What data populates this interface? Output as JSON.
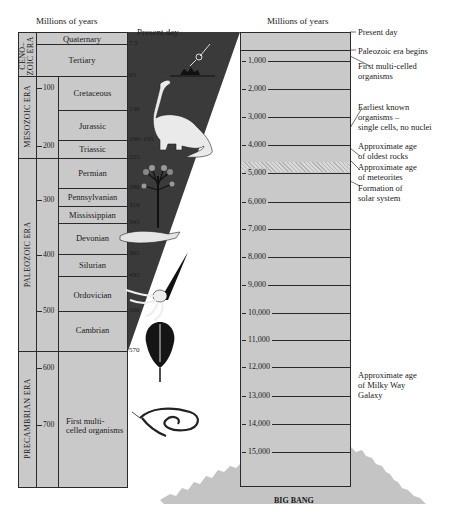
{
  "left_scale": {
    "header": "Millions of years",
    "present_day_label": "Present day",
    "eras": [
      {
        "name": "CENO-\nZOIC ERA",
        "line1": "CENO–",
        "line2": "ZOIC ERA"
      },
      {
        "name": "MESOZOIC ERA"
      },
      {
        "name": "PALEOZOIC ERA"
      },
      {
        "name": "PRECAMBRIAN ERA"
      }
    ],
    "periods": [
      {
        "name": "Quaternary"
      },
      {
        "name": "Tertiary"
      },
      {
        "name": "Cretaceous"
      },
      {
        "name": "Jurassic"
      },
      {
        "name": "Triassic"
      },
      {
        "name": "Permian"
      },
      {
        "name": "Pennsylvanian"
      },
      {
        "name": "Mississippian"
      },
      {
        "name": "Devonian"
      },
      {
        "name": "Silurian"
      },
      {
        "name": "Ordovician"
      },
      {
        "name": "Cambrian"
      },
      {
        "name": "First multi-celled organisms",
        "line1": "First multi-",
        "line2": "celled organisms"
      }
    ],
    "boundaries": [
      "7.5",
      "65",
      "136",
      "190–195",
      "225",
      "280",
      "310",
      "345",
      "395",
      "435",
      "500",
      "570"
    ],
    "ticks": [
      "100",
      "200",
      "300",
      "400",
      "500",
      "600",
      "700"
    ]
  },
  "right_scale": {
    "header": "Millions of years",
    "ticks": [
      "1,000",
      "2,000",
      "3,000",
      "4,000",
      "5,000",
      "6,000",
      "7,000",
      "8,000",
      "9,000",
      "10,000",
      "11,000",
      "12,000",
      "13,000",
      "14,000",
      "15,000"
    ],
    "annotations": [
      {
        "text": "Present day"
      },
      {
        "text": "Paleozoic era begins"
      },
      {
        "line1": "First multi-celled",
        "line2": "organisms"
      },
      {
        "line1": "Earliest known",
        "line2": "organisms –",
        "line3": "single cells, no nuclei"
      },
      {
        "line1": "Approximate age",
        "line2": "of oldest  rocks"
      },
      {
        "line1": "Approximate age",
        "line2": "of meteorites"
      },
      {
        "line1": "Formation of",
        "line2": "solar system"
      },
      {
        "line1": "Approximate age",
        "line2": "of Milky Way",
        "line3": "Galaxy"
      }
    ],
    "big_bang_label": "BIG BANG"
  },
  "illustrations": [
    {
      "icon": "meteor-impact-icon"
    },
    {
      "icon": "dinosaur-icon"
    },
    {
      "icon": "tree-fern-icon"
    },
    {
      "icon": "fish-icon"
    },
    {
      "icon": "nautiloid-icon"
    },
    {
      "icon": "trilobite-icon"
    },
    {
      "icon": "worm-organism-icon"
    }
  ],
  "colors": {
    "column_fill": "#c9c9c9",
    "wedge_fill": "#3a3a3a",
    "big_bang_fill": "#c4c4c4",
    "line": "#2a2a2a"
  }
}
